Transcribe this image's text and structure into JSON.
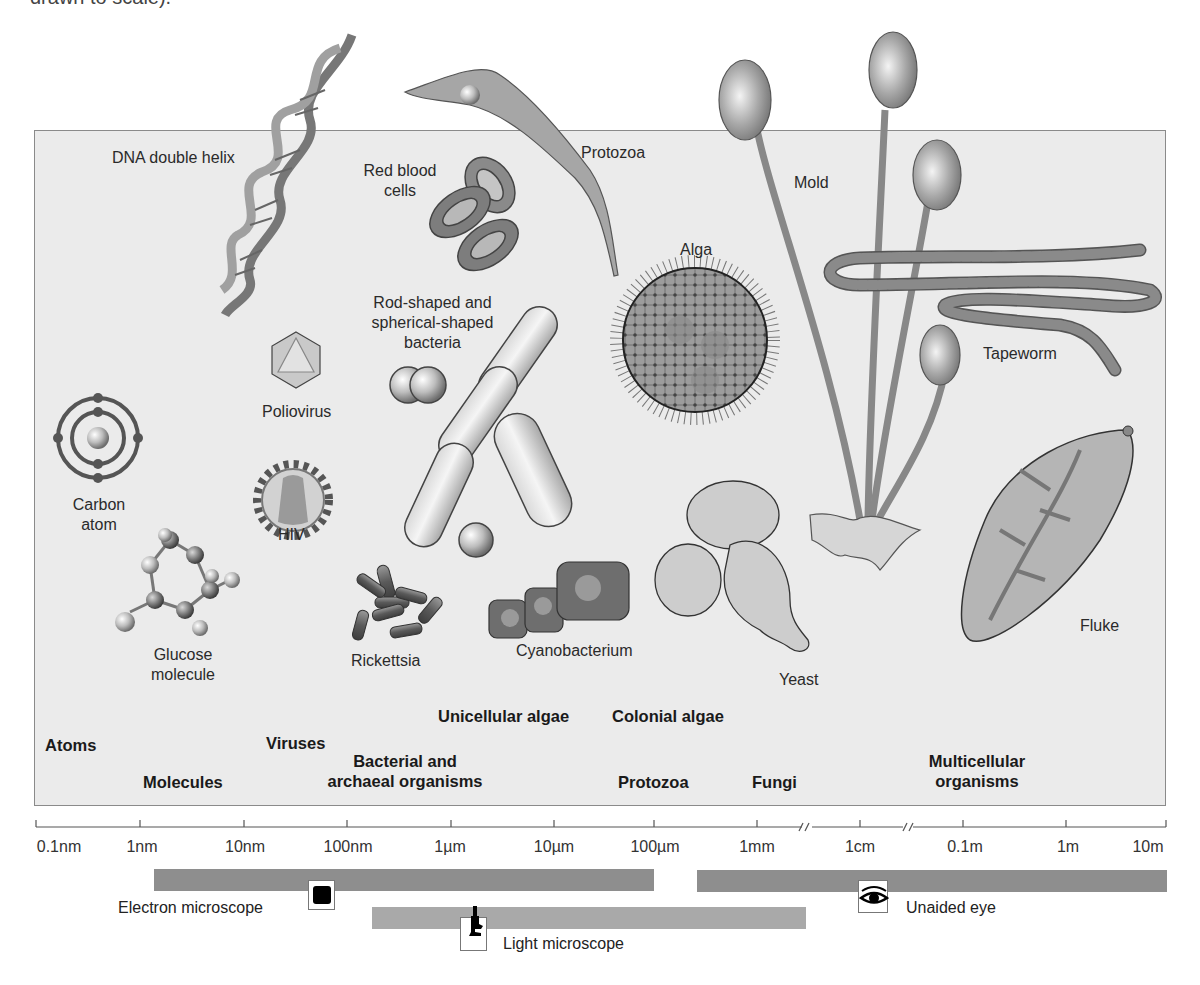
{
  "caption": "drawn to scale).",
  "colors": {
    "panel_bg": "#ebebeb",
    "panel_border": "#8a8a8a",
    "electron_bar": "#8e8e8e",
    "light_bar": "#a9a9a9",
    "unaided_bar": "#8e8e8e",
    "axis": "#555555"
  },
  "specimens": [
    {
      "id": "dna",
      "label": "DNA double helix"
    },
    {
      "id": "rbc",
      "label_line1": "Red blood",
      "label_line2": "cells"
    },
    {
      "id": "protozoa",
      "label": "Protozoa"
    },
    {
      "id": "mold",
      "label": "Mold"
    },
    {
      "id": "alga",
      "label": "Alga"
    },
    {
      "id": "bacteria",
      "label_line1": "Rod-shaped and",
      "label_line2": "spherical-shaped",
      "label_line3": "bacteria"
    },
    {
      "id": "poliovirus",
      "label": "Poliovirus"
    },
    {
      "id": "tapeworm",
      "label": "Tapeworm"
    },
    {
      "id": "carbon",
      "label_line1": "Carbon",
      "label_line2": "atom"
    },
    {
      "id": "hiv",
      "label": "HIV"
    },
    {
      "id": "glucose",
      "label_line1": "Glucose",
      "label_line2": "molecule"
    },
    {
      "id": "rickettsia",
      "label": "Rickettsia"
    },
    {
      "id": "cyanobacterium",
      "label": "Cyanobacterium"
    },
    {
      "id": "yeast",
      "label": "Yeast"
    },
    {
      "id": "fluke",
      "label": "Fluke"
    }
  ],
  "categories": {
    "atoms": "Atoms",
    "molecules": "Molecules",
    "viruses": "Viruses",
    "bacterial_line1": "Bacterial and",
    "bacterial_line2": "archaeal organisms",
    "unicellular_algae": "Unicellular algae",
    "colonial_algae": "Colonial algae",
    "protozoa": "Protozoa",
    "fungi": "Fungi",
    "multicellular_line1": "Multicellular",
    "multicellular_line2": "organisms"
  },
  "scale": {
    "ticks": [
      "0.1nm",
      "1nm",
      "10nm",
      "100nm",
      "1µm",
      "10µm",
      "100µm",
      "1mm",
      "1cm",
      "0.1m",
      "1m",
      "10m"
    ],
    "breaks_between": [
      [
        "1mm",
        "1cm"
      ],
      [
        "1cm",
        "0.1m"
      ]
    ]
  },
  "instruments": {
    "electron": {
      "label": "Electron microscope",
      "icon": "electron-microscope-icon",
      "range": [
        "~1nm",
        "100µm"
      ]
    },
    "light": {
      "label": "Light microscope",
      "icon": "light-microscope-icon",
      "range": [
        "~200nm",
        "~1mm"
      ]
    },
    "unaided": {
      "label": "Unaided eye",
      "icon": "eye-icon",
      "range": [
        "~200µm",
        "10m"
      ]
    }
  }
}
